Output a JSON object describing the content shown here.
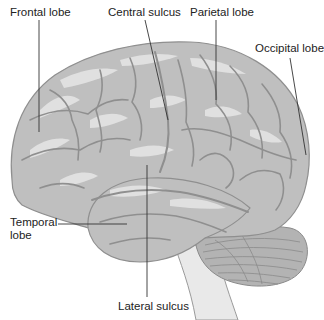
{
  "diagram": {
    "colors": {
      "background": "#ffffff",
      "cortex": "#bfbfbf",
      "cortex_highlight": "#e6e6e6",
      "sulci": "#8f8f8f",
      "cerebellum": "#b3b3b3",
      "brainstem": "#e9e9e9",
      "leader_line": "#333333",
      "label_text": "#222222"
    },
    "labels": [
      {
        "id": "frontal",
        "text": "Frontal lobe"
      },
      {
        "id": "central",
        "text": "Central sulcus"
      },
      {
        "id": "parietal",
        "text": "Parietal lobe"
      },
      {
        "id": "occipital",
        "text": "Occipital lobe"
      },
      {
        "id": "temporal",
        "text_line1": "Temporal",
        "text_line2": "lobe"
      },
      {
        "id": "lateral",
        "text": "Lateral sulcus"
      }
    ]
  }
}
